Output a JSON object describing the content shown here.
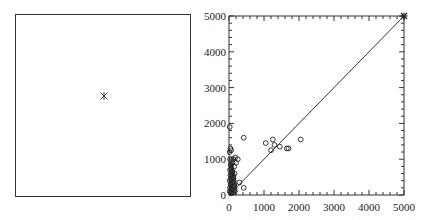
{
  "chart_data": [
    {
      "type": "scatter",
      "title": "",
      "xlabel": "",
      "ylabel": "",
      "axes_visible": false,
      "frame": true,
      "points": [
        {
          "x": 0.5,
          "y": 0.55,
          "marker": "asterisk"
        }
      ]
    },
    {
      "type": "scatter",
      "title": "",
      "xlabel": "",
      "ylabel": "",
      "xlim": [
        0,
        5000
      ],
      "ylim": [
        0,
        5000
      ],
      "xticks": [
        "0",
        "1000",
        "2000",
        "3000",
        "4000",
        "5000"
      ],
      "yticks": [
        "0",
        "1000",
        "2000",
        "3000",
        "4000",
        "5000"
      ],
      "grid": false,
      "reference_line": {
        "from": [
          0,
          0
        ],
        "to": [
          5000,
          5000
        ],
        "label": "y = x"
      },
      "series": [
        {
          "name": "points",
          "marker": "open-circle",
          "points": [
            {
              "x": 20,
              "y": 1900
            },
            {
              "x": 40,
              "y": 1300
            },
            {
              "x": 60,
              "y": 1250
            },
            {
              "x": 20,
              "y": 1200
            },
            {
              "x": 30,
              "y": 1000
            },
            {
              "x": 80,
              "y": 1000
            },
            {
              "x": 130,
              "y": 1000
            },
            {
              "x": 180,
              "y": 1050
            },
            {
              "x": 250,
              "y": 1000
            },
            {
              "x": 200,
              "y": 900
            },
            {
              "x": 100,
              "y": 900
            },
            {
              "x": 50,
              "y": 850
            },
            {
              "x": 150,
              "y": 800
            },
            {
              "x": 30,
              "y": 700
            },
            {
              "x": 90,
              "y": 650
            },
            {
              "x": 160,
              "y": 600
            },
            {
              "x": 40,
              "y": 550
            },
            {
              "x": 120,
              "y": 500
            },
            {
              "x": 60,
              "y": 450
            },
            {
              "x": 20,
              "y": 400
            },
            {
              "x": 100,
              "y": 350
            },
            {
              "x": 50,
              "y": 300
            },
            {
              "x": 150,
              "y": 250
            },
            {
              "x": 30,
              "y": 200
            },
            {
              "x": 80,
              "y": 150
            },
            {
              "x": 20,
              "y": 100
            },
            {
              "x": 60,
              "y": 50
            },
            {
              "x": 300,
              "y": 350
            },
            {
              "x": 420,
              "y": 200
            },
            {
              "x": 420,
              "y": 1600
            },
            {
              "x": 1050,
              "y": 1450
            },
            {
              "x": 1200,
              "y": 1250
            },
            {
              "x": 1250,
              "y": 1550
            },
            {
              "x": 1300,
              "y": 1400
            },
            {
              "x": 1450,
              "y": 1350
            },
            {
              "x": 1650,
              "y": 1300
            },
            {
              "x": 1700,
              "y": 1300
            },
            {
              "x": 2050,
              "y": 1550
            },
            {
              "x": 5000,
              "y": 5000
            }
          ]
        }
      ]
    }
  ],
  "left_panel": {
    "marker_label": "*"
  },
  "right_panel": {
    "xtick_labels": [
      "0",
      "1000",
      "2000",
      "3000",
      "4000",
      "5000"
    ],
    "ytick_labels": [
      "0",
      "1000",
      "2000",
      "3000",
      "4000",
      "5000"
    ]
  }
}
